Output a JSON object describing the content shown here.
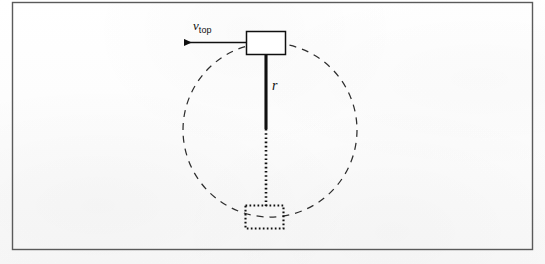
{
  "figure": {
    "background_color": "#fdfdfd",
    "ink_color": "#101010",
    "frame": {
      "name": "figure-border",
      "stroke_color": "#555555",
      "x": 12,
      "y": 2,
      "width": 521,
      "height": 248
    },
    "labels": {
      "velocity": {
        "symbol": "v",
        "subscript": "top",
        "full_text": "v top"
      },
      "radius": {
        "symbol": "r"
      }
    },
    "circle": {
      "name": "motion-path",
      "style": "dashed",
      "center_x": 270,
      "center_y": 130,
      "radius": 87,
      "stroke_color": "#2a2a2a"
    },
    "top_block": {
      "name": "block-at-top",
      "style": "solid",
      "x": 246,
      "y": 31,
      "width": 40,
      "height": 24,
      "stroke_color": "#101010"
    },
    "bottom_block": {
      "name": "block-at-bottom-ghost",
      "style": "dotted",
      "x": 245,
      "y": 205,
      "width": 39,
      "height": 24,
      "stroke_color": "#101010"
    },
    "rod": {
      "name": "rod",
      "solid_segment": {
        "x": 266,
        "y1": 55,
        "y2": 129
      },
      "dotted_segment": {
        "x": 266,
        "y1": 129,
        "y2": 205
      },
      "stroke_color": "#101010"
    },
    "velocity_arrow": {
      "name": "velocity-arrow",
      "direction": "left",
      "tail_x": 247,
      "tip_x": 176,
      "y": 42,
      "stroke_color": "#101010"
    }
  }
}
